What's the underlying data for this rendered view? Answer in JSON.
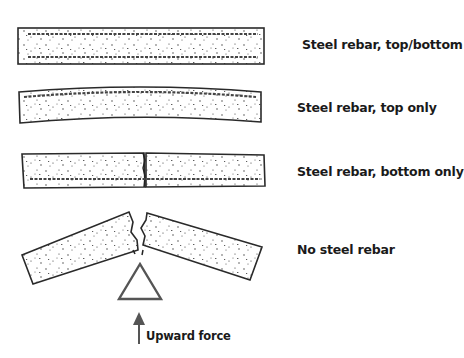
{
  "diagram": {
    "beams": [
      {
        "id": "top-bottom",
        "label": "Steel rebar, top/bottom"
      },
      {
        "id": "top-only",
        "label": "Steel rebar, top only"
      },
      {
        "id": "bottom-only",
        "label": "Steel rebar, bottom only"
      },
      {
        "id": "none",
        "label": "No steel rebar"
      }
    ],
    "force_label": "Upward force",
    "colors": {
      "line": "#2a2a2a",
      "fill": "#ffffff",
      "rebar": "#444444",
      "arrow": "#555555"
    }
  }
}
